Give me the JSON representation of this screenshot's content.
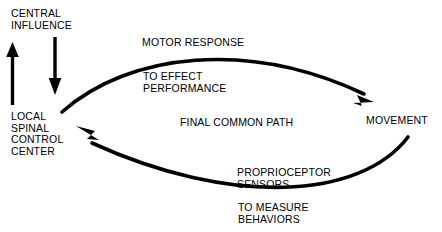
{
  "diagram": {
    "background_color": "#ffffff",
    "stroke_color": "#000000",
    "text_color": "#000000",
    "nodes": [
      {
        "id": "central_influence",
        "label": "CENTRAL\nINFLUENCE"
      },
      {
        "id": "local_spinal_control_center",
        "label": "LOCAL\nSPINAL\nCONTROL\nCENTER"
      },
      {
        "id": "movement",
        "label": "MOVEMENT"
      }
    ],
    "edge_labels": [
      {
        "id": "motor_response",
        "label": "MOTOR RESPONSE"
      },
      {
        "id": "to_effect_performance",
        "label": "TO EFFECT\nPERFORMANCE"
      },
      {
        "id": "final_common_path",
        "label": "FINAL COMMON PATH"
      },
      {
        "id": "proprioceptor_sensors",
        "label": "PROPRIOCEPTOR\nSENSORS"
      },
      {
        "id": "to_measure_behaviors",
        "label": "TO MEASURE\nBEHAVIORS"
      }
    ],
    "arrows": [
      {
        "id": "ascending-feedback-arrow",
        "direction": "up",
        "from": "local_spinal_control_center",
        "to": "central_influence"
      },
      {
        "id": "descending-command-arrow",
        "direction": "down",
        "from": "central_influence",
        "to": "local_spinal_control_center"
      },
      {
        "id": "motor-output-arc",
        "direction": "right",
        "from": "local_spinal_control_center",
        "to": "movement"
      },
      {
        "id": "sensory-feedback-arc",
        "direction": "left",
        "from": "movement",
        "to": "local_spinal_control_center"
      }
    ]
  }
}
